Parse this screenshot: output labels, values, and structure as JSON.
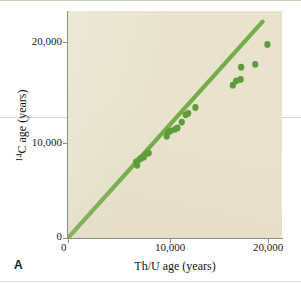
{
  "panel": {
    "label": "A"
  },
  "axes": {
    "x": {
      "title": "Th/U age (years)",
      "ticks": [
        "0",
        "10,000",
        "20,000"
      ]
    },
    "y": {
      "title_prefix": "14",
      "title_rest": "C age (years)",
      "ticks": [
        "0",
        "10,000",
        "20,000"
      ]
    }
  },
  "colors": {
    "plot_background": "#e9e3cd",
    "marker": "#5d9c3a",
    "line": "#74ad4a",
    "axis": "#8d8e84",
    "text": "#1a1a1a",
    "page_background": "#ffffff"
  },
  "chart_data": {
    "type": "scatter",
    "title": "",
    "xlabel": "Th/U age (years)",
    "ylabel": "14C age (years)",
    "xlim": [
      0,
      22000
    ],
    "ylim": [
      0,
      23400
    ],
    "grid": false,
    "legend": null,
    "series": [
      {
        "name": "coral samples",
        "type": "scatter",
        "marker_color": "#5d9c3a",
        "points": [
          [
            7000,
            7850
          ],
          [
            7100,
            7500
          ],
          [
            7350,
            8100
          ],
          [
            7550,
            8250
          ],
          [
            7800,
            8350
          ],
          [
            8050,
            8700
          ],
          [
            8300,
            8750
          ],
          [
            10150,
            10500
          ],
          [
            10300,
            10900
          ],
          [
            10550,
            11050
          ],
          [
            11000,
            11200
          ],
          [
            11250,
            11350
          ],
          [
            11700,
            11950
          ],
          [
            12100,
            12700
          ],
          [
            12350,
            12850
          ],
          [
            13100,
            13450
          ],
          [
            16950,
            15750
          ],
          [
            17300,
            16200
          ],
          [
            17750,
            16350
          ],
          [
            17800,
            17600
          ],
          [
            19250,
            17900
          ],
          [
            20500,
            19950
          ]
        ]
      },
      {
        "name": "1:1 reference line",
        "type": "line",
        "line_color": "#74ad4a",
        "points": [
          [
            0,
            0
          ],
          [
            20000,
            22300
          ]
        ]
      }
    ]
  }
}
